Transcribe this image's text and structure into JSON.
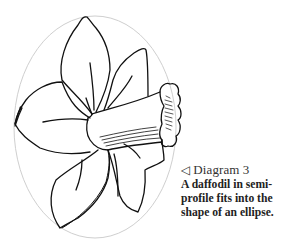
{
  "diagram": {
    "label_icon": "◁",
    "label": "Diagram 3",
    "caption_lines": [
      "A daffodil in semi-",
      "profile fits into the",
      "shape of an ellipse."
    ],
    "colors": {
      "ellipse": "#d0d0d0",
      "ink": "#111111",
      "background": "#ffffff"
    }
  }
}
